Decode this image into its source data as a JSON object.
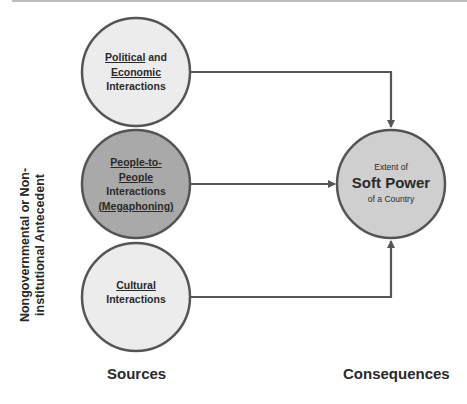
{
  "diagram": {
    "sources": [
      {
        "id": "political-economic",
        "lines": [
          {
            "parts": [
              {
                "text": "Political",
                "underline": true
              },
              {
                "text": " and",
                "underline": false
              }
            ]
          },
          {
            "parts": [
              {
                "text": "Economic",
                "underline": true
              }
            ]
          },
          {
            "parts": [
              {
                "text": "Interactions",
                "underline": false
              }
            ]
          }
        ],
        "fill": "#ececec"
      },
      {
        "id": "people-to-people",
        "lines": [
          {
            "parts": [
              {
                "text": "People-to-",
                "underline": true
              }
            ]
          },
          {
            "parts": [
              {
                "text": "People",
                "underline": true
              }
            ]
          },
          {
            "parts": [
              {
                "text": "Interactions",
                "underline": false
              }
            ]
          },
          {
            "parts": [
              {
                "text": "(Megaphoning)",
                "underline": true
              }
            ]
          }
        ],
        "fill": "#a9a9a9"
      },
      {
        "id": "cultural",
        "lines": [
          {
            "parts": [
              {
                "text": "Cultural",
                "underline": true
              }
            ]
          },
          {
            "parts": [
              {
                "text": "Interactions",
                "underline": false
              }
            ]
          }
        ],
        "fill": "#ececec"
      }
    ],
    "consequence": {
      "line1": "Extent of",
      "line2": "Soft Power",
      "line3": "of a Country",
      "fill": "#cfcfcf"
    },
    "labels": {
      "sources": "Sources",
      "consequences": "Consequences",
      "vertical_line1": "Nongovernmental or Non-",
      "vertical_line2": "institutional Antecedent"
    },
    "colors": {
      "stroke": "#555555",
      "text": "#2a2a2a"
    }
  }
}
